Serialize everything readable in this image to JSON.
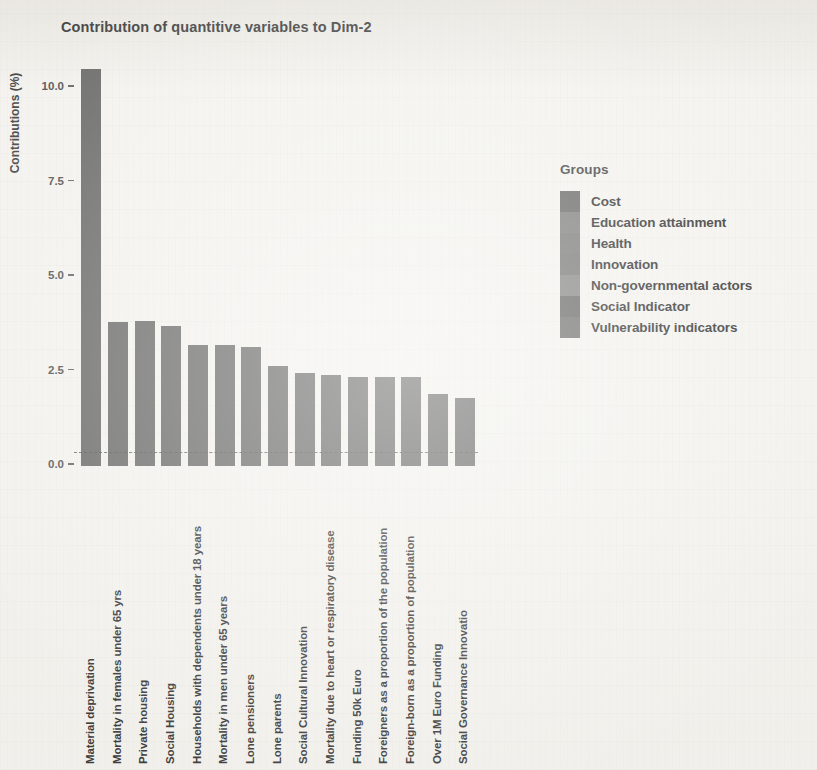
{
  "chart_data": {
    "type": "bar",
    "title": "Contribution of quantitive variables to Dim-2",
    "xlabel": "",
    "ylabel": "Contributions (%)",
    "ylim": [
      0,
      10.8
    ],
    "grid": false,
    "legend_position": "right",
    "y_ticks": [
      "0.0",
      "2.5",
      "5.0",
      "7.5",
      "10.0"
    ],
    "y_tick_values": [
      0.0,
      2.5,
      5.0,
      7.5,
      10.0
    ],
    "reference_line": {
      "value": 0.35,
      "style": "dashed",
      "label": ""
    },
    "categories": [
      "Material deprivation",
      "Mortality in females under 65 yrs",
      "Private housing",
      "Social Housing",
      "Households with dependents under 18 years",
      "Mortality in men under 65 years",
      "Lone pensioners",
      "Lone parents",
      "Social Cultural Innovation",
      "Mortality due to heart or respiratory disease",
      "Funding 50k Euro",
      "Foreigners as a proportion of the population",
      "Foreign-born as a proportion of population",
      "Over 1M Euro Funding",
      "Social Governance Innovatio"
    ],
    "values": [
      10.5,
      3.8,
      3.85,
      3.7,
      3.2,
      3.2,
      3.15,
      2.65,
      2.45,
      2.4,
      2.35,
      2.35,
      2.35,
      1.9,
      1.8
    ],
    "bar_groups": [
      "Vulnerability indicators",
      "Health",
      "Social Indicator",
      "Social Indicator",
      "Social Indicator",
      "Health",
      "Social Indicator",
      "Social Indicator",
      "Innovation",
      "Health",
      "Cost",
      "Non-governmental actors",
      "Non-governmental actors",
      "Cost",
      "Innovation"
    ],
    "bar_color": "#70706f"
  },
  "legend": {
    "title": "Groups",
    "items": [
      {
        "label": "Cost",
        "color": "#6d6d6c"
      },
      {
        "label": "Education attainment",
        "color": "#828281"
      },
      {
        "label": "Health",
        "color": "#7d7d7c"
      },
      {
        "label": "Innovation",
        "color": "#7a7a79"
      },
      {
        "label": "Non-governmental actors",
        "color": "#888887"
      },
      {
        "label": "Social Indicator",
        "color": "#6a6a69"
      },
      {
        "label": "Vulnerability indicators",
        "color": "#737372"
      }
    ]
  },
  "page": {
    "background": "#f3f2ee",
    "axis_text_color": "#3d3d3d"
  }
}
